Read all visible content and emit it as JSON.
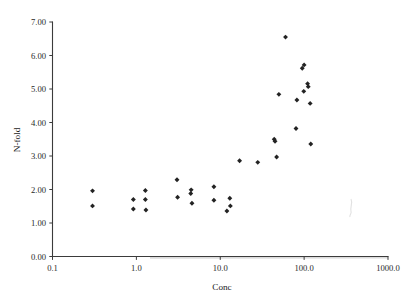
{
  "chart_data": {
    "type": "scatter",
    "title": "",
    "xlabel": "Conc",
    "ylabel": "N-fold",
    "xscale": "log",
    "yscale": "linear",
    "xlim": [
      0.1,
      1000.0
    ],
    "ylim": [
      0.0,
      7.0
    ],
    "grid": false,
    "legend": null,
    "xticks": [
      0.1,
      1.0,
      10.0,
      100.0,
      1000.0
    ],
    "xticklabels": [
      "0.1",
      "1.0",
      "10.0",
      "100.0",
      "1000.0"
    ],
    "yticks": [
      0.0,
      1.0,
      2.0,
      3.0,
      4.0,
      5.0,
      6.0,
      7.0
    ],
    "yticklabels": [
      "0.00",
      "1.00",
      "2.00",
      "3.00",
      "4.00",
      "5.00",
      "6.00",
      "7.00"
    ],
    "marker": "diamond",
    "marker_color": "#232323",
    "points": [
      {
        "x": 0.3,
        "y": 1.96
      },
      {
        "x": 0.3,
        "y": 1.51
      },
      {
        "x": 0.92,
        "y": 1.7
      },
      {
        "x": 0.92,
        "y": 1.42
      },
      {
        "x": 1.28,
        "y": 1.97
      },
      {
        "x": 1.28,
        "y": 1.7
      },
      {
        "x": 1.3,
        "y": 1.39
      },
      {
        "x": 3.05,
        "y": 2.29
      },
      {
        "x": 3.1,
        "y": 1.77
      },
      {
        "x": 4.5,
        "y": 1.99
      },
      {
        "x": 4.45,
        "y": 1.88
      },
      {
        "x": 4.6,
        "y": 1.59
      },
      {
        "x": 8.4,
        "y": 2.08
      },
      {
        "x": 8.4,
        "y": 1.68
      },
      {
        "x": 12.0,
        "y": 1.36
      },
      {
        "x": 13.0,
        "y": 1.74
      },
      {
        "x": 13.2,
        "y": 1.51
      },
      {
        "x": 17.0,
        "y": 2.86
      },
      {
        "x": 28.0,
        "y": 2.81
      },
      {
        "x": 44.0,
        "y": 3.5
      },
      {
        "x": 45.0,
        "y": 3.44
      },
      {
        "x": 47.0,
        "y": 2.97
      },
      {
        "x": 50.0,
        "y": 4.84
      },
      {
        "x": 60.0,
        "y": 6.55
      },
      {
        "x": 80.0,
        "y": 3.82
      },
      {
        "x": 82.0,
        "y": 4.67
      },
      {
        "x": 95.0,
        "y": 5.62
      },
      {
        "x": 100.0,
        "y": 5.72
      },
      {
        "x": 99.0,
        "y": 4.93
      },
      {
        "x": 110.0,
        "y": 5.16
      },
      {
        "x": 112.0,
        "y": 5.07
      },
      {
        "x": 118.0,
        "y": 4.57
      },
      {
        "x": 120.0,
        "y": 3.36
      }
    ]
  }
}
